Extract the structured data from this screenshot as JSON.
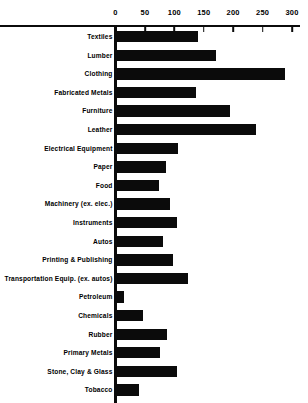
{
  "chart_data": {
    "type": "bar",
    "orientation": "horizontal",
    "title": "",
    "subtitle": "",
    "xlabel": "",
    "ylabel": "",
    "xlim": [
      0,
      300
    ],
    "grid": false,
    "legend": null,
    "axis_position": "top",
    "tick_labels": [
      "0",
      "50",
      "100",
      "150",
      "200",
      "250",
      "300"
    ],
    "ticks": [
      0,
      50,
      100,
      150,
      200,
      250,
      300
    ],
    "bar_color": "#0b0b0b",
    "background_color": "#ffffff",
    "categories": [
      "Textiles",
      "Lumber",
      "Clothing",
      "Fabricated Metals",
      "Furniture",
      "Leather",
      "Electrical Equipment",
      "Paper",
      "Food",
      "Machinery (ex. elec.)",
      "Instruments",
      "Autos",
      "Printing & Publishing",
      "Transportation Equip. (ex. autos)",
      "Petroleum",
      "Chemicals",
      "Rubber",
      "Primary Metals",
      "Stone, Clay & Glass",
      "Tobacco"
    ],
    "values": [
      140,
      170,
      288,
      137,
      194,
      238,
      107,
      86,
      74,
      93,
      105,
      81,
      98,
      124,
      15,
      47,
      88,
      75,
      105,
      40
    ]
  }
}
